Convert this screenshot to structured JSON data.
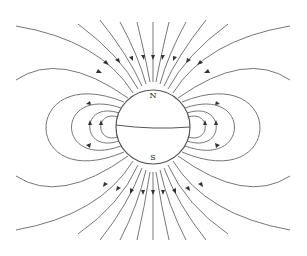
{
  "diagram": {
    "poles": {
      "north": "N",
      "south": "S"
    },
    "colors": {
      "field_line": "#777777",
      "sphere_stroke": "#555555",
      "arrow": "#333333"
    }
  }
}
